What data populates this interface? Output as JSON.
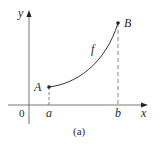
{
  "diagram": {
    "caption": "(a)",
    "axes": {
      "x_label": "x",
      "y_label": "y",
      "origin_label": "0"
    },
    "curve": {
      "label": "f",
      "start_point": {
        "label": "A",
        "x_label": "a"
      },
      "end_point": {
        "label": "B",
        "x_label": "b"
      }
    },
    "colors": {
      "ink": "#2a2a2a",
      "axis": "#555555",
      "curve": "#333333"
    }
  }
}
